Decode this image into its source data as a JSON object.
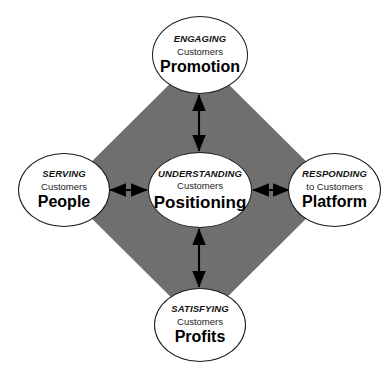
{
  "diagram": {
    "colors": {
      "diamond_fill": "#6f6f6f",
      "node_fill": "#ffffff",
      "node_stroke": "#1a1a1a",
      "arrow": "#000000",
      "background": "#ffffff"
    },
    "shapes": {
      "diamond_name": "gray-diamond"
    },
    "nodes": [
      {
        "id": "promotion",
        "position": "top",
        "eyebrow": "ENGAGING",
        "sub": "Customers",
        "title": "Promotion"
      },
      {
        "id": "people",
        "position": "left",
        "eyebrow": "SERVING",
        "sub": "Customers",
        "title": "People"
      },
      {
        "id": "positioning",
        "position": "center",
        "eyebrow": "UNDERSTANDING",
        "sub": "Customers",
        "title": "Positioning"
      },
      {
        "id": "platform",
        "position": "right",
        "eyebrow": "RESPONDING",
        "sub": "to Customers",
        "title": "Platform"
      },
      {
        "id": "profits",
        "position": "bottom",
        "eyebrow": "SATISFYING",
        "sub": "Customers",
        "title": "Profits"
      }
    ],
    "connectors": [
      {
        "id": "center-to-promotion",
        "from": "positioning",
        "to": "promotion",
        "style": "double-headed-arrow",
        "orientation": "vertical"
      },
      {
        "id": "center-to-profits",
        "from": "positioning",
        "to": "profits",
        "style": "double-headed-arrow",
        "orientation": "vertical"
      },
      {
        "id": "center-to-people",
        "from": "positioning",
        "to": "people",
        "style": "double-headed-arrow",
        "orientation": "horizontal"
      },
      {
        "id": "center-to-platform",
        "from": "positioning",
        "to": "platform",
        "style": "double-headed-arrow",
        "orientation": "horizontal"
      }
    ]
  }
}
